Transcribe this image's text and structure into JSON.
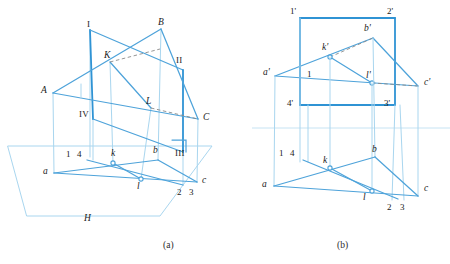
{
  "figure": {
    "colors": {
      "line_primary": "#4ea3da",
      "line_strong": "#2f93d4",
      "line_faint": "#a9d6ef",
      "hidden_line": "#8a8a8a",
      "label_text": "#1a1a1a",
      "background": "#ffffff"
    },
    "captions": [
      {
        "id": "caption-a",
        "text": "(a)",
        "x": 163,
        "y": 243
      },
      {
        "id": "caption-b",
        "text": "(b)",
        "x": 337,
        "y": 243
      }
    ]
  },
  "diagram_a": {
    "name": "pictorial-view",
    "caption": "(a)",
    "plane_label": "H",
    "labels": [
      {
        "id": "label-I",
        "text": "I",
        "x": 87,
        "y": 20,
        "style": "roman"
      },
      {
        "id": "label-B",
        "text": "B",
        "x": 158,
        "y": 18,
        "style": "italic"
      },
      {
        "id": "label-K",
        "text": "K",
        "x": 104,
        "y": 53,
        "style": "italic"
      },
      {
        "id": "label-II",
        "text": "II",
        "x": 177,
        "y": 58,
        "style": "roman"
      },
      {
        "id": "label-A",
        "text": "A",
        "x": 42,
        "y": 88,
        "style": "italic"
      },
      {
        "id": "label-L",
        "text": "L",
        "x": 146,
        "y": 99,
        "style": "italic"
      },
      {
        "id": "label-C",
        "text": "C",
        "x": 203,
        "y": 117,
        "style": "italic"
      },
      {
        "id": "label-IV",
        "text": "IV",
        "x": 81,
        "y": 112,
        "style": "roman"
      },
      {
        "id": "label-III",
        "text": "III",
        "x": 176,
        "y": 153,
        "style": "roman"
      },
      {
        "id": "label-1",
        "text": "1",
        "x": 66,
        "y": 153,
        "style": "num"
      },
      {
        "id": "label-4",
        "text": "4",
        "x": 77,
        "y": 153,
        "style": "num"
      },
      {
        "id": "label-k",
        "text": "k",
        "x": 112,
        "y": 152,
        "style": "italic"
      },
      {
        "id": "label-b",
        "text": "b",
        "x": 153,
        "y": 150,
        "style": "italic"
      },
      {
        "id": "label-a",
        "text": "a",
        "x": 44,
        "y": 171,
        "style": "italic"
      },
      {
        "id": "label-l",
        "text": "l",
        "x": 137,
        "y": 185,
        "style": "italic"
      },
      {
        "id": "label-c",
        "text": "c",
        "x": 202,
        "y": 180,
        "style": "italic"
      },
      {
        "id": "label-2",
        "text": "2",
        "x": 178,
        "y": 192,
        "style": "num"
      },
      {
        "id": "label-3",
        "text": "3",
        "x": 190,
        "y": 192,
        "style": "num"
      },
      {
        "id": "label-H",
        "text": "H",
        "x": 84,
        "y": 218,
        "style": "italic"
      }
    ]
  },
  "diagram_b": {
    "name": "orthographic-view",
    "caption": "(b)",
    "labels": [
      {
        "id": "label-1p",
        "text": "1'",
        "x": 291,
        "y": 9,
        "style": "num"
      },
      {
        "id": "label-2p",
        "text": "2'",
        "x": 388,
        "y": 9,
        "style": "num"
      },
      {
        "id": "label-bp",
        "text": "b'",
        "x": 364,
        "y": 26,
        "style": "italic"
      },
      {
        "id": "label-kp",
        "text": "k'",
        "x": 324,
        "y": 45,
        "style": "italic"
      },
      {
        "id": "label-ap",
        "text": "a'",
        "x": 264,
        "y": 70,
        "style": "italic"
      },
      {
        "id": "label-1b",
        "text": "1",
        "x": 307,
        "y": 73,
        "style": "num"
      },
      {
        "id": "label-lp",
        "text": "l'",
        "x": 366,
        "y": 73,
        "style": "italic"
      },
      {
        "id": "label-cp",
        "text": "c'",
        "x": 424,
        "y": 81,
        "style": "italic"
      },
      {
        "id": "label-4p",
        "text": "4'",
        "x": 288,
        "y": 102,
        "style": "num"
      },
      {
        "id": "label-3p",
        "text": "3'",
        "x": 385,
        "y": 102,
        "style": "num"
      },
      {
        "id": "label-1h",
        "text": "1",
        "x": 280,
        "y": 152,
        "style": "num"
      },
      {
        "id": "label-4h",
        "text": "4",
        "x": 291,
        "y": 152,
        "style": "num"
      },
      {
        "id": "label-kh",
        "text": "k",
        "x": 324,
        "y": 159,
        "style": "italic"
      },
      {
        "id": "label-bh",
        "text": "b",
        "x": 372,
        "y": 149,
        "style": "italic"
      },
      {
        "id": "label-ah",
        "text": "a",
        "x": 263,
        "y": 184,
        "style": "italic"
      },
      {
        "id": "label-lh",
        "text": "l",
        "x": 363,
        "y": 196,
        "style": "italic"
      },
      {
        "id": "label-ch",
        "text": "c",
        "x": 424,
        "y": 188,
        "style": "italic"
      },
      {
        "id": "label-2h",
        "text": "2",
        "x": 388,
        "y": 207,
        "style": "num"
      },
      {
        "id": "label-3h",
        "text": "3",
        "x": 401,
        "y": 207,
        "style": "num"
      }
    ]
  },
  "geometry_a": {
    "points": {
      "I": [
        90,
        30
      ],
      "B": [
        161,
        29
      ],
      "II": [
        183,
        70
      ],
      "C": [
        198,
        119
      ],
      "A": [
        53,
        93
      ],
      "K": [
        110,
        62
      ],
      "L": [
        151,
        108
      ],
      "IV": [
        93,
        119
      ],
      "III": [
        183,
        144
      ],
      "a": [
        54,
        173
      ],
      "b": [
        158,
        160
      ],
      "c": [
        197,
        182
      ],
      "k": [
        113,
        163
      ],
      "l": [
        141,
        179
      ],
      "p1": [
        76,
        157
      ],
      "p4": [
        87,
        157
      ],
      "p2": [
        181,
        185
      ],
      "p3": [
        192,
        185
      ]
    }
  },
  "geometry_b": {
    "points": {
      "1p": [
        300,
        18
      ],
      "2p": [
        395,
        18
      ],
      "4p": [
        300,
        105
      ],
      "3p": [
        395,
        105
      ],
      "ap": [
        275,
        76
      ],
      "bp": [
        373,
        38
      ],
      "cp": [
        418,
        86
      ],
      "kp": [
        330,
        57
      ],
      "lp": [
        372,
        83
      ],
      "a": [
        274,
        186
      ],
      "b": [
        375,
        157
      ],
      "c": [
        418,
        196
      ],
      "k": [
        330,
        168
      ],
      "l": [
        372,
        191
      ],
      "ground_y": 128
    }
  }
}
